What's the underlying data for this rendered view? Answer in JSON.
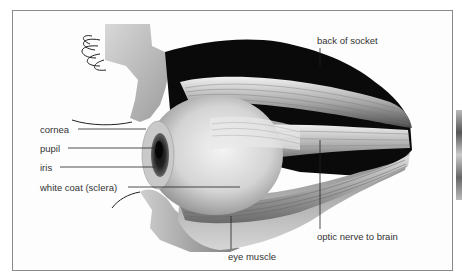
{
  "diagram": {
    "labels": {
      "back_of_socket": "back of socket",
      "cornea": "cornea",
      "pupil": "pupil",
      "iris": "iris",
      "sclera": "white coat (sclera)",
      "eye_muscle": "eye muscle",
      "optic_nerve": "optic nerve to brain"
    },
    "colors": {
      "socket": "#0a0a0a",
      "muscle": "#9a9a9a",
      "eyeball": "#dcdcdc",
      "skin": "#b5b5b5",
      "leader_line": "#222222",
      "frame_border": "#8a8a8a"
    }
  }
}
